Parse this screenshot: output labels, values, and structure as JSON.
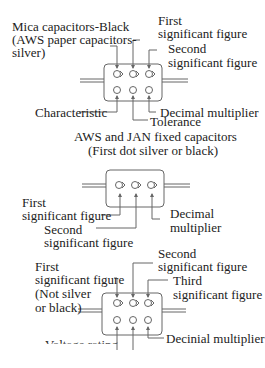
{
  "diagram1": {
    "labels": {
      "mica": [
        "Mica capacitors-Black",
        "(AWS paper capacitors-",
        " silver)"
      ],
      "first": [
        "First",
        "significant figure"
      ],
      "second": [
        "Second",
        "significant figure"
      ],
      "characteristic": "Characteristic",
      "decimal": "Decimal multiplier",
      "tolerance": "Tolerance"
    }
  },
  "diagram2": {
    "title": [
      "AWS and JAN fixed capacitors",
      "(First dot silver or black)"
    ],
    "labels": {
      "first": [
        "First",
        "significant figure"
      ],
      "second": [
        "Second",
        "significant figure"
      ],
      "decimal": [
        "Decimal",
        "multiplier"
      ]
    }
  },
  "diagram3": {
    "labels": {
      "first": [
        "First",
        "significant figure",
        "(Not silver",
        "or black)"
      ],
      "second": [
        "Second",
        "significant figure"
      ],
      "third": [
        "Third",
        "significant figure"
      ],
      "decimal": "Decinial multiplier",
      "voltage": "Voltage rating"
    }
  }
}
